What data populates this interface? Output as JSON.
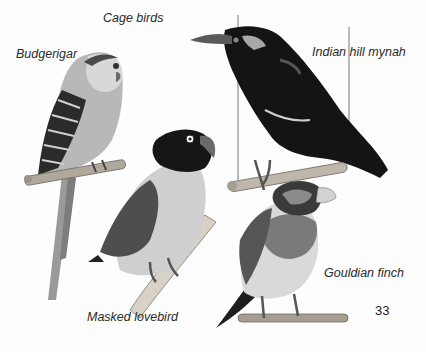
{
  "page": {
    "title": "Cage birds",
    "page_number": "33",
    "labels": {
      "budgerigar": "Budgerigar",
      "mynah": "Indian hill mynah",
      "lovebird": "Masked lovebird",
      "finch": "Gouldian finch"
    }
  },
  "illustrations": [
    {
      "name": "Budgerigar",
      "tone": "light grey with barred dark wings, long tail"
    },
    {
      "name": "Indian hill mynah",
      "tone": "glossy black with pale wattle and orange-grey beak"
    },
    {
      "name": "Masked lovebird",
      "tone": "black head, pale breast, grey wings"
    },
    {
      "name": "Gouldian finch",
      "tone": "dark face mask, banded breast, pale belly"
    }
  ]
}
